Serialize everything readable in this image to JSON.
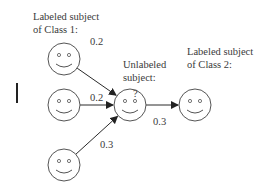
{
  "labels": {
    "class1": [
      "Labeled subject",
      "of Class 1:"
    ],
    "unlabeled": [
      "Unlabeled",
      "subject:"
    ],
    "class2": [
      "Labeled subject",
      "of Class 2:"
    ],
    "unknown_mark": "?"
  },
  "nodes": [
    {
      "id": "class1-a",
      "role": "labeled-class-1",
      "icon": "smiley-face-icon"
    },
    {
      "id": "class1-b",
      "role": "labeled-class-1",
      "icon": "smiley-face-icon"
    },
    {
      "id": "class1-c",
      "role": "labeled-class-1",
      "icon": "smiley-face-icon"
    },
    {
      "id": "unlabeled",
      "role": "unlabeled",
      "icon": "smiley-face-icon"
    },
    {
      "id": "class2",
      "role": "labeled-class-2",
      "icon": "smiley-face-icon"
    }
  ],
  "edges": [
    {
      "from": "class1-a",
      "to": "unlabeled",
      "weight": "0.2"
    },
    {
      "from": "class1-b",
      "to": "unlabeled",
      "weight": "0.2"
    },
    {
      "from": "class1-c",
      "to": "unlabeled",
      "weight": "0.3"
    },
    {
      "from": "unlabeled",
      "to": "class2",
      "weight": "0.3"
    }
  ],
  "colors": {
    "stroke": "#3a3a3a",
    "face_stroke": "#555555",
    "background": "#ffffff"
  }
}
